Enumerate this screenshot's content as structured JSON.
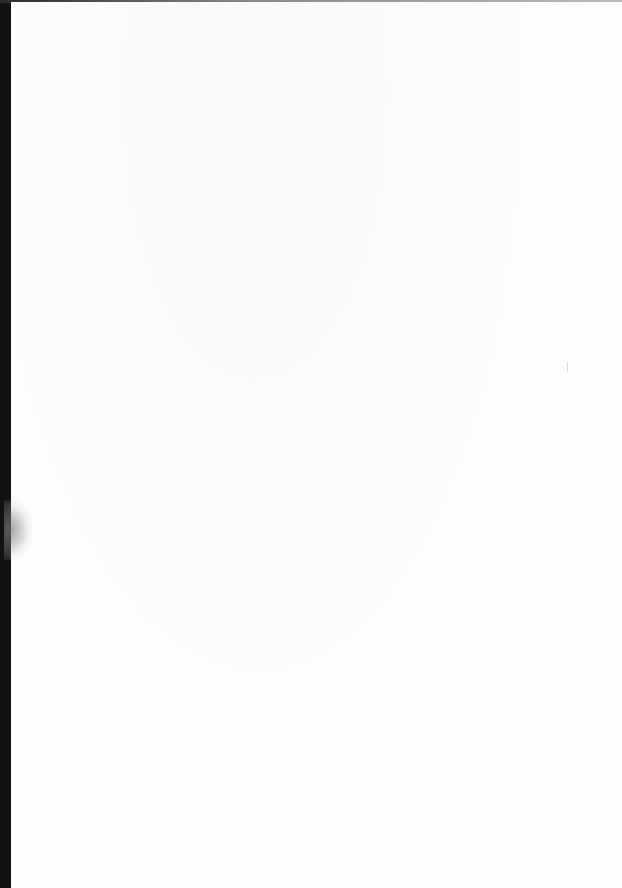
{
  "document": {
    "type": "scanned-page",
    "content": "",
    "colors": {
      "paper": "#fdfdfd",
      "binding_edge": "#111111"
    }
  }
}
